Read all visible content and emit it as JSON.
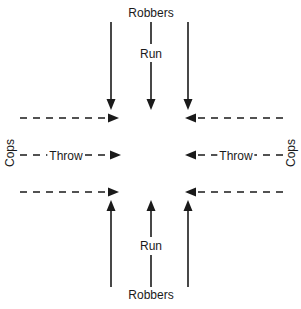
{
  "diagram": {
    "title_top": "Robbers",
    "title_bottom": "Robbers",
    "canvas": {
      "width": 301,
      "height": 309,
      "background": "#ffffff"
    },
    "ink_color": "#1a1a1a",
    "labels": {
      "robbers_top": "Robbers",
      "run_top": "Run",
      "cops_left": "Cops",
      "throw_left": "Throw",
      "throw_right": "Throw",
      "cops_right": "Cops",
      "run_bottom": "Run",
      "robbers_bottom": "Robbers"
    },
    "flows": [
      {
        "id": "robbers-down-left",
        "actor": "Robbers",
        "action": "Run",
        "direction": "down",
        "line_style": "solid",
        "x": 111,
        "from_y": 22,
        "to_y": 108
      },
      {
        "id": "robbers-down-center",
        "actor": "Robbers",
        "action": "Run",
        "direction": "down",
        "line_style": "solid",
        "x": 151,
        "from_y": 22,
        "to_y": 108
      },
      {
        "id": "robbers-down-right",
        "actor": "Robbers",
        "action": "Run",
        "direction": "down",
        "line_style": "solid",
        "x": 188,
        "from_y": 22,
        "to_y": 108
      },
      {
        "id": "cops-throw-upper-left",
        "actor": "Cops",
        "action": "Throw",
        "direction": "right",
        "line_style": "dashed",
        "y": 118,
        "from_x": 20,
        "to_x": 118
      },
      {
        "id": "cops-throw-upper-right",
        "actor": "Cops",
        "action": "Throw",
        "direction": "left",
        "line_style": "dashed",
        "y": 118,
        "from_x": 283,
        "to_x": 185
      },
      {
        "id": "cops-throw-mid-left",
        "actor": "Cops",
        "action": "Throw",
        "direction": "right",
        "line_style": "dashed",
        "y": 155,
        "from_x": 20,
        "to_x": 120
      },
      {
        "id": "cops-throw-mid-right",
        "actor": "Cops",
        "action": "Throw",
        "direction": "left",
        "line_style": "dashed",
        "y": 155,
        "from_x": 283,
        "to_x": 185
      },
      {
        "id": "cops-throw-lower-left",
        "actor": "Cops",
        "action": "Throw",
        "direction": "right",
        "line_style": "dashed",
        "y": 192,
        "from_x": 20,
        "to_x": 118
      },
      {
        "id": "cops-throw-lower-right",
        "actor": "Cops",
        "action": "Throw",
        "direction": "left",
        "line_style": "dashed",
        "y": 192,
        "from_x": 283,
        "to_x": 185
      },
      {
        "id": "robbers-up-left",
        "actor": "Robbers",
        "action": "Run",
        "direction": "up",
        "line_style": "solid",
        "x": 111,
        "from_y": 287,
        "to_y": 200
      },
      {
        "id": "robbers-up-center",
        "actor": "Robbers",
        "action": "Run",
        "direction": "up",
        "line_style": "solid",
        "x": 151,
        "from_y": 287,
        "to_y": 200
      },
      {
        "id": "robbers-up-right",
        "actor": "Robbers",
        "action": "Run",
        "direction": "up",
        "line_style": "solid",
        "x": 188,
        "from_y": 287,
        "to_y": 200
      }
    ]
  }
}
